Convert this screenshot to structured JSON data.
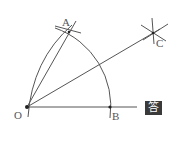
{
  "diagram": {
    "points": {
      "O": {
        "label": "O",
        "x": 27,
        "y": 107
      },
      "A": {
        "label": "A",
        "x": 69,
        "y": 32
      },
      "B": {
        "label": "B",
        "x": 110,
        "y": 107
      },
      "C": {
        "label": "C",
        "x": 153,
        "y": 33
      }
    },
    "answer_badge": "答",
    "stroke_color": "#555555"
  }
}
